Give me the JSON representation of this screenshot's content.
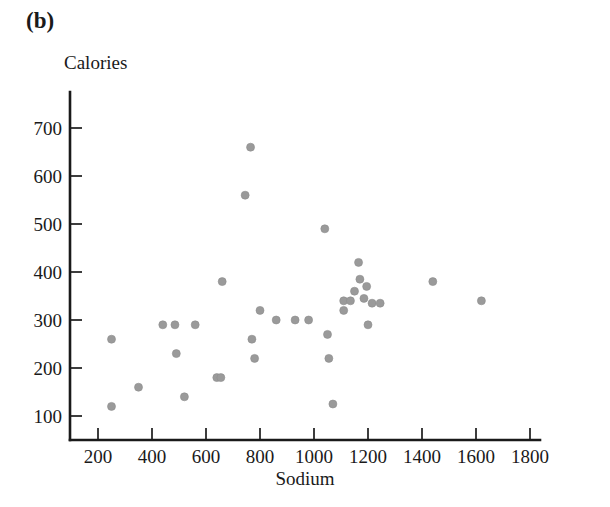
{
  "figure": {
    "panel_label": "(b)",
    "ylabel": "Calories",
    "xlabel": "Sodium"
  },
  "chart_data": {
    "type": "scatter",
    "title": "",
    "panel": "(b)",
    "xlabel": "Sodium",
    "ylabel": "Calories",
    "xlim": [
      100,
      1900
    ],
    "ylim": [
      80,
      740
    ],
    "xticks": [
      200,
      400,
      600,
      800,
      1000,
      1200,
      1400,
      1600,
      1800
    ],
    "yticks": [
      100,
      200,
      300,
      400,
      500,
      600,
      700
    ],
    "xtick_labels": [
      "200",
      "400",
      "600",
      "800",
      "1000",
      "1200",
      "1400",
      "1600",
      "1800"
    ],
    "ytick_labels": [
      "100",
      "200",
      "300",
      "400",
      "500",
      "600",
      "700"
    ],
    "grid": false,
    "legend": false,
    "marker": {
      "shape": "circle",
      "color": "#9a9a9a",
      "size": 7
    },
    "points": [
      {
        "x": 250,
        "y": 260
      },
      {
        "x": 250,
        "y": 120
      },
      {
        "x": 350,
        "y": 160
      },
      {
        "x": 440,
        "y": 290
      },
      {
        "x": 485,
        "y": 290
      },
      {
        "x": 490,
        "y": 230
      },
      {
        "x": 520,
        "y": 140
      },
      {
        "x": 560,
        "y": 290
      },
      {
        "x": 640,
        "y": 180
      },
      {
        "x": 655,
        "y": 180
      },
      {
        "x": 660,
        "y": 380
      },
      {
        "x": 765,
        "y": 660
      },
      {
        "x": 745,
        "y": 560
      },
      {
        "x": 770,
        "y": 260
      },
      {
        "x": 780,
        "y": 220
      },
      {
        "x": 800,
        "y": 320
      },
      {
        "x": 860,
        "y": 300
      },
      {
        "x": 930,
        "y": 300
      },
      {
        "x": 980,
        "y": 300
      },
      {
        "x": 1040,
        "y": 490
      },
      {
        "x": 1050,
        "y": 270
      },
      {
        "x": 1055,
        "y": 220
      },
      {
        "x": 1070,
        "y": 125
      },
      {
        "x": 1110,
        "y": 340
      },
      {
        "x": 1110,
        "y": 320
      },
      {
        "x": 1135,
        "y": 340
      },
      {
        "x": 1150,
        "y": 360
      },
      {
        "x": 1165,
        "y": 420
      },
      {
        "x": 1170,
        "y": 385
      },
      {
        "x": 1185,
        "y": 345
      },
      {
        "x": 1195,
        "y": 370
      },
      {
        "x": 1215,
        "y": 335
      },
      {
        "x": 1245,
        "y": 335
      },
      {
        "x": 1200,
        "y": 290
      },
      {
        "x": 1440,
        "y": 380
      },
      {
        "x": 1620,
        "y": 340
      }
    ]
  }
}
